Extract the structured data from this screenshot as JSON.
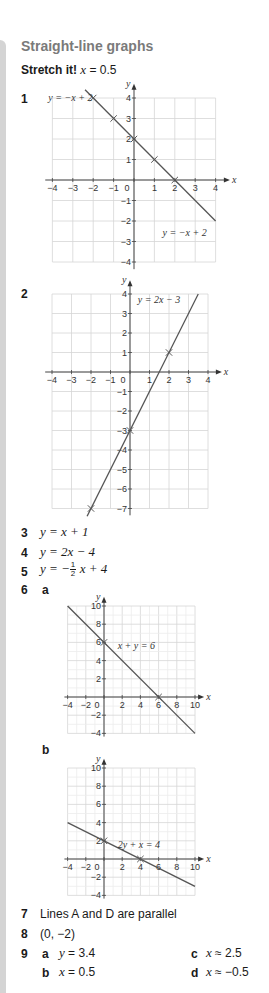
{
  "page": {
    "title": "Straight-line graphs",
    "stretch": {
      "label": "Stretch it!",
      "answer_var": "x",
      "answer_eq": " = 0.5"
    }
  },
  "questions": {
    "q1": {
      "number": "1"
    },
    "q2": {
      "number": "2"
    },
    "q3": {
      "number": "3",
      "lhs": "y",
      "rhs": " = x + 1"
    },
    "q4": {
      "number": "4",
      "lhs": "y",
      "rhs": " = 2x − 4"
    },
    "q5": {
      "number": "5",
      "lhs": "y",
      "mid": " = −",
      "frac_num": "1",
      "frac_den": "2",
      "rhs": "x + 4"
    },
    "q6": {
      "number": "6",
      "a_label": "a",
      "b_label": "b"
    },
    "q7": {
      "number": "7",
      "text": "Lines A and D are parallel"
    },
    "q8": {
      "number": "8",
      "text": "(0, −2)"
    },
    "q9": {
      "number": "9",
      "a": {
        "label": "a",
        "var": "y",
        "val": " = 3.4"
      },
      "b": {
        "label": "b",
        "var": "x",
        "val": " = 0.5"
      },
      "c": {
        "label": "c",
        "var": "x",
        "val": " ≈ 2.5"
      },
      "d": {
        "label": "d",
        "var": "x",
        "val": " ≈ −0.5"
      }
    }
  },
  "chart_data": [
    {
      "type": "line",
      "id": "q1",
      "title": "",
      "xlabel": "x",
      "ylabel": "y",
      "xlim": [
        -4,
        4
      ],
      "ylim": [
        -4,
        4
      ],
      "grid": true,
      "x_ticks": [
        "−4",
        "−3",
        "−2",
        "−1",
        "0",
        "1",
        "2",
        "3",
        "4"
      ],
      "y_ticks": [
        "4",
        "3",
        "2",
        "1",
        "−1",
        "−2",
        "−3",
        "−4"
      ],
      "series": [
        {
          "name": "y = −x + 2",
          "x": [
            -2.4,
            4
          ],
          "y": [
            4.4,
            -2
          ]
        }
      ],
      "marked_points": [
        [
          -2,
          4
        ],
        [
          -1,
          3
        ],
        [
          0,
          2
        ],
        [
          1,
          1
        ],
        [
          2,
          0
        ]
      ],
      "annotations": [
        "y = −x + 2",
        "y = −x + 2"
      ]
    },
    {
      "type": "line",
      "id": "q2",
      "title": "",
      "xlabel": "x",
      "ylabel": "y",
      "xlim": [
        -4,
        4
      ],
      "ylim": [
        -7,
        4
      ],
      "grid": true,
      "x_ticks": [
        "−4",
        "−3",
        "−2",
        "−1",
        "0",
        "1",
        "2",
        "3",
        "4"
      ],
      "y_ticks": [
        "4",
        "3",
        "2",
        "1",
        "−1",
        "−2",
        "−3",
        "−4",
        "−5",
        "−6",
        "−7"
      ],
      "series": [
        {
          "name": "y = 2x − 3",
          "x": [
            -2.2,
            3.5
          ],
          "y": [
            -7.4,
            4
          ]
        }
      ],
      "marked_points": [
        [
          2,
          1
        ],
        [
          0,
          -3
        ],
        [
          -2,
          -7
        ]
      ],
      "annotations": [
        "y = 2x − 3"
      ]
    },
    {
      "type": "line",
      "id": "q6a",
      "title": "",
      "xlabel": "x",
      "ylabel": "y",
      "xlim": [
        -4,
        10
      ],
      "ylim": [
        -4,
        10
      ],
      "grid": true,
      "x_ticks": [
        "−4",
        "−2",
        "0",
        "2",
        "4",
        "6",
        "8",
        "10"
      ],
      "y_ticks": [
        "10",
        "8",
        "6",
        "4",
        "2",
        "−2",
        "−4"
      ],
      "series": [
        {
          "name": "x + y = 6",
          "x": [
            -4,
            10
          ],
          "y": [
            10,
            -4
          ]
        }
      ],
      "marked_points": [
        [
          0,
          6
        ],
        [
          6,
          0
        ]
      ],
      "annotations": [
        "x + y = 6"
      ]
    },
    {
      "type": "line",
      "id": "q6b",
      "title": "",
      "xlabel": "x",
      "ylabel": "y",
      "xlim": [
        -4,
        10
      ],
      "ylim": [
        -4,
        10
      ],
      "grid": true,
      "x_ticks": [
        "−4",
        "−2",
        "0",
        "2",
        "4",
        "6",
        "8",
        "10"
      ],
      "y_ticks": [
        "10",
        "8",
        "6",
        "4",
        "2",
        "−2",
        "−4"
      ],
      "series": [
        {
          "name": "2y + x = 4",
          "x": [
            -4,
            10
          ],
          "y": [
            4,
            -3
          ]
        }
      ],
      "marked_points": [
        [
          0,
          2
        ],
        [
          4,
          0
        ]
      ],
      "annotations": [
        "2y + x = 4"
      ]
    }
  ]
}
